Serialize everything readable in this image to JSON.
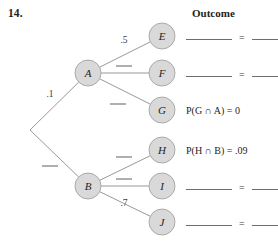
{
  "problem": {
    "number": "14."
  },
  "header": {
    "outcome_label": "Outcome"
  },
  "colors": {
    "node_fill": "#d9d9d9",
    "node_stroke": "#9a9a9a",
    "edge_stroke": "#8c8c8c",
    "text": "#231f20",
    "blank_rule": "#6d6d6d"
  },
  "tree": {
    "root": {
      "name": "root",
      "x": 30,
      "y": 130
    },
    "nodes": [
      {
        "id": "A",
        "label": "A",
        "x": 88,
        "y": 73,
        "r": 13
      },
      {
        "id": "B",
        "label": "B",
        "x": 88,
        "y": 186,
        "r": 13
      },
      {
        "id": "E",
        "label": "E",
        "x": 162,
        "y": 36,
        "r": 13
      },
      {
        "id": "F",
        "label": "F",
        "x": 162,
        "y": 73,
        "r": 13
      },
      {
        "id": "G",
        "label": "G",
        "x": 162,
        "y": 110,
        "r": 13
      },
      {
        "id": "H",
        "label": "H",
        "x": 162,
        "y": 150,
        "r": 13
      },
      {
        "id": "I",
        "label": "I",
        "x": 162,
        "y": 186,
        "r": 13
      },
      {
        "id": "J",
        "label": "J",
        "x": 162,
        "y": 222,
        "r": 13
      }
    ],
    "edges": [
      {
        "id": "root-A",
        "from": "root",
        "to": "A",
        "label": ".1",
        "blank": false,
        "lx": 50,
        "ly": 97
      },
      {
        "id": "root-B",
        "from": "root",
        "to": "B",
        "label": "",
        "blank": true,
        "lx": 50,
        "ly": 166
      },
      {
        "id": "A-E",
        "from": "A",
        "to": "E",
        "label": ".5",
        "blank": false,
        "lx": 124,
        "ly": 43
      },
      {
        "id": "A-F",
        "from": "A",
        "to": "F",
        "label": "",
        "blank": true,
        "lx": 124,
        "ly": 66
      },
      {
        "id": "A-G",
        "from": "A",
        "to": "G",
        "label": "",
        "blank": true,
        "lx": 118,
        "ly": 104
      },
      {
        "id": "B-H",
        "from": "B",
        "to": "H",
        "label": "",
        "blank": true,
        "lx": 124,
        "ly": 157
      },
      {
        "id": "B-I",
        "from": "B",
        "to": "I",
        "label": "",
        "blank": true,
        "lx": 124,
        "ly": 179
      },
      {
        "id": "B-J",
        "from": "B",
        "to": "J",
        "label": ".7",
        "blank": false,
        "lx": 124,
        "ly": 206
      }
    ]
  },
  "outcomes": [
    {
      "node": "E",
      "kind": "blanks",
      "text": "",
      "x": 186,
      "y": 30
    },
    {
      "node": "F",
      "kind": "blanks",
      "text": "",
      "x": 186,
      "y": 67
    },
    {
      "node": "G",
      "kind": "formula",
      "text": "P(G ∩ A) = 0",
      "x": 186,
      "y": 105
    },
    {
      "node": "H",
      "kind": "formula",
      "text": "P(H ∩ B) = .09",
      "x": 186,
      "y": 145
    },
    {
      "node": "I",
      "kind": "blanks",
      "text": "",
      "x": 186,
      "y": 180
    },
    {
      "node": "J",
      "kind": "blanks",
      "text": "",
      "x": 186,
      "y": 216
    }
  ],
  "outcome_blank": {
    "equals": "="
  }
}
